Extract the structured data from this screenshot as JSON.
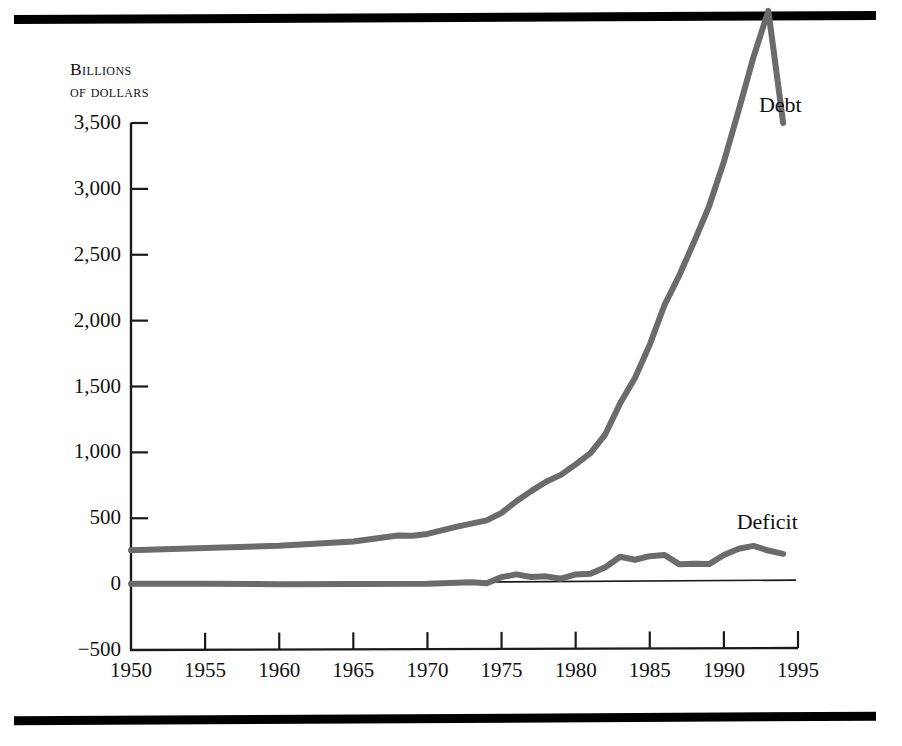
{
  "figure": {
    "axis_caption_line1": "Billions",
    "axis_caption_line2": "of dollars",
    "debt_label": "Debt",
    "deficit_label": "Deficit",
    "line_color_debt": "#6b6b6b",
    "line_color_deficit": "#6b6b6b",
    "zero_line_color": "#1a1a1a",
    "axis_color": "#1a1a1a",
    "rule_color": "#000000"
  },
  "chart_data": {
    "type": "line",
    "title": "",
    "subtitle": "",
    "xlabel": "",
    "ylabel": "Billions of dollars",
    "xlim": [
      1950,
      1995
    ],
    "ylim": [
      -500,
      3500
    ],
    "xticks": [
      1950,
      1955,
      1960,
      1965,
      1970,
      1975,
      1980,
      1985,
      1990,
      1995
    ],
    "xtick_labels": [
      "1950",
      "1955",
      "1960",
      "1965",
      "1970",
      "1975",
      "1980",
      "1985",
      "1990",
      "1995"
    ],
    "yticks": [
      -500,
      0,
      500,
      1000,
      1500,
      2000,
      2500,
      3000,
      3500
    ],
    "ytick_labels": [
      "−500",
      "0",
      "500",
      "1,000",
      "1,500",
      "2,000",
      "2,500",
      "3,000",
      "3,500"
    ],
    "grid": false,
    "legend_position": "inline-series-labels",
    "annotations": [
      {
        "text": "Debt",
        "x": 1992.5,
        "y": 3640
      },
      {
        "text": "Deficit",
        "x": 1991.0,
        "y": 470
      }
    ],
    "series": [
      {
        "name": "Debt",
        "label": "Debt",
        "color": "#6b6b6b",
        "x": [
          1950,
          1955,
          1960,
          1965,
          1968,
          1969,
          1970,
          1972,
          1974,
          1975,
          1976,
          1977,
          1978,
          1979,
          1980,
          1981,
          1982,
          1983,
          1984,
          1985,
          1986,
          1987,
          1988,
          1989,
          1990,
          1991,
          1992,
          1993,
          1994
        ],
        "values": [
          257,
          274,
          291,
          323,
          369,
          367,
          381,
          436,
          484,
          541,
          629,
          706,
          777,
          829,
          909,
          994,
          1137,
          1372,
          1565,
          1818,
          2120,
          2346,
          2601,
          2868,
          3207,
          3598,
          4002,
          4351,
          3500
        ]
      },
      {
        "name": "Deficit",
        "label": "Deficit",
        "color": "#6b6b6b",
        "x": [
          1950,
          1955,
          1960,
          1965,
          1970,
          1973,
          1974,
          1975,
          1976,
          1977,
          1978,
          1979,
          1980,
          1981,
          1982,
          1983,
          1984,
          1985,
          1986,
          1987,
          1988,
          1989,
          1990,
          1991,
          1992,
          1993,
          1994
        ],
        "values": [
          3,
          3,
          0,
          1,
          3,
          15,
          6,
          53,
          74,
          54,
          59,
          41,
          74,
          79,
          128,
          208,
          185,
          212,
          221,
          150,
          155,
          152,
          221,
          269,
          290,
          255,
          230
        ]
      }
    ]
  }
}
